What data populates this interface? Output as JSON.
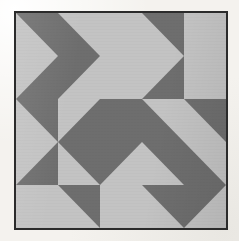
{
  "image": {
    "subject": "geometric patchwork quilt",
    "pattern_name": "half-square-triangle diamond quilt",
    "grid_rows": 5,
    "grid_columns": 5,
    "frame_border_color": "#2b2b2b",
    "background_color": "#f4f2ee"
  },
  "palette": {
    "dark": "#6e6e6e",
    "light": "#c3c3c3",
    "dark_label": "dark gray",
    "light_label": "light gray"
  },
  "quilt": {
    "cells": [
      {
        "row": 1,
        "col": 1,
        "type": "split",
        "diagonal": "tr",
        "base": "light",
        "tri": "dark"
      },
      {
        "row": 1,
        "col": 2,
        "type": "split",
        "diagonal": "bl",
        "base": "light",
        "tri": "dark"
      },
      {
        "row": 1,
        "col": 3,
        "type": "solid",
        "base": "light"
      },
      {
        "row": 1,
        "col": 4,
        "type": "split",
        "diagonal": "tr",
        "base": "light",
        "tri": "dark"
      },
      {
        "row": 1,
        "col": 5,
        "type": "solid",
        "base": "light"
      },
      {
        "row": 2,
        "col": 1,
        "type": "split",
        "diagonal": "br",
        "base": "light",
        "tri": "dark"
      },
      {
        "row": 2,
        "col": 2,
        "type": "split",
        "diagonal": "tl",
        "base": "light",
        "tri": "dark"
      },
      {
        "row": 2,
        "col": 3,
        "type": "solid",
        "base": "light"
      },
      {
        "row": 2,
        "col": 4,
        "type": "split",
        "diagonal": "br",
        "base": "light",
        "tri": "dark"
      },
      {
        "row": 2,
        "col": 5,
        "type": "solid",
        "base": "light"
      },
      {
        "row": 3,
        "col": 1,
        "type": "split",
        "diagonal": "tr",
        "base": "light",
        "tri": "dark"
      },
      {
        "row": 3,
        "col": 2,
        "type": "split",
        "diagonal": "br",
        "base": "light",
        "tri": "dark"
      },
      {
        "row": 3,
        "col": 3,
        "type": "solid",
        "base": "dark"
      },
      {
        "row": 3,
        "col": 4,
        "type": "split",
        "diagonal": "bl",
        "base": "light",
        "tri": "dark"
      },
      {
        "row": 3,
        "col": 5,
        "type": "split",
        "diagonal": "tr",
        "base": "light",
        "tri": "dark"
      },
      {
        "row": 4,
        "col": 1,
        "type": "split",
        "diagonal": "br",
        "base": "light",
        "tri": "dark"
      },
      {
        "row": 4,
        "col": 2,
        "type": "split",
        "diagonal": "tr",
        "base": "light",
        "tri": "dark"
      },
      {
        "row": 4,
        "col": 3,
        "type": "split",
        "diagonal": "tl",
        "base": "light",
        "tri": "dark"
      },
      {
        "row": 4,
        "col": 4,
        "type": "split",
        "diagonal": "tr",
        "base": "light",
        "tri": "dark"
      },
      {
        "row": 4,
        "col": 5,
        "type": "split",
        "diagonal": "bl",
        "base": "light",
        "tri": "dark"
      },
      {
        "row": 5,
        "col": 1,
        "type": "solid",
        "base": "light"
      },
      {
        "row": 5,
        "col": 2,
        "type": "split",
        "diagonal": "tr",
        "base": "light",
        "tri": "dark"
      },
      {
        "row": 5,
        "col": 3,
        "type": "solid",
        "base": "light"
      },
      {
        "row": 5,
        "col": 4,
        "type": "split",
        "diagonal": "tr",
        "base": "light",
        "tri": "dark"
      },
      {
        "row": 5,
        "col": 5,
        "type": "split",
        "diagonal": "tl",
        "base": "light",
        "tri": "dark"
      }
    ]
  }
}
